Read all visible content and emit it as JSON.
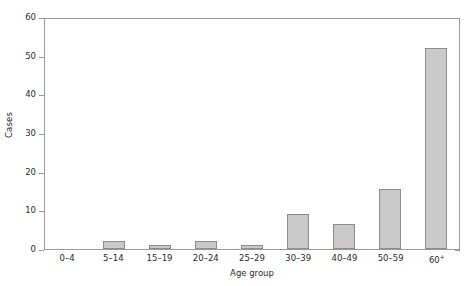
{
  "chart_data": {
    "type": "bar",
    "title": "",
    "subtitle": "",
    "xlabel": "Age group",
    "ylabel": "Cases",
    "categories": [
      "0–4",
      "5–14",
      "15–19",
      "20–24",
      "25–29",
      "30–39",
      "40–49",
      "50–59",
      "60⁺"
    ],
    "values": [
      0,
      2,
      1,
      2,
      1,
      9,
      6.5,
      15.5,
      52
    ],
    "ylim": [
      0,
      60
    ],
    "y_ticks": [
      0,
      10,
      20,
      30,
      40,
      50,
      60
    ],
    "y_tick_labels": [
      "0",
      "10",
      "20",
      "30",
      "40",
      "50",
      "60"
    ],
    "grid": false,
    "legend": false,
    "legend_position": "none",
    "bar_fill_color": "#c9c9c9",
    "bar_edge_color": "#8d8d8d",
    "axis_color": "#9a9a9a",
    "background_color": "#ffffff",
    "annotations": []
  }
}
